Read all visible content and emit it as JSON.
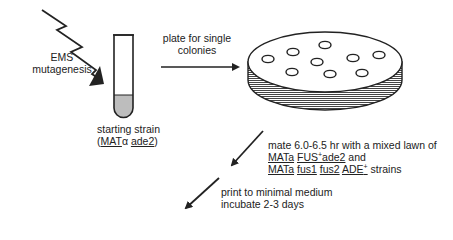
{
  "mutagenesis": {
    "line1": "EMS",
    "line2": "mutagenesis"
  },
  "starting_strain": {
    "label": "starting strain",
    "open_paren": "(",
    "mat": "MAT",
    "alpha": "α",
    "gene": "ade2",
    "close_paren": ")"
  },
  "plate_step": {
    "line1": "plate for single",
    "line2": "colonies"
  },
  "mate_step": {
    "line1": "mate 6.0-6.5 hr with a mixed lawn of",
    "line2": {
      "mat": "MATa",
      "fus": "FUS",
      "fus_sup": "+",
      "ade": "ade2",
      "tail": " and"
    },
    "line3": {
      "mat": "MATa",
      "fus1": "fus1",
      "fus2": "fus2",
      "ade": "ADE",
      "ade_sup": "+",
      "tail": " strains"
    }
  },
  "print_step": {
    "line1": "print to minimal medium",
    "line2": "incubate 2-3 days"
  },
  "colors": {
    "ink": "#222222",
    "agar": "#bdbdbd",
    "hatch": "#444444"
  }
}
